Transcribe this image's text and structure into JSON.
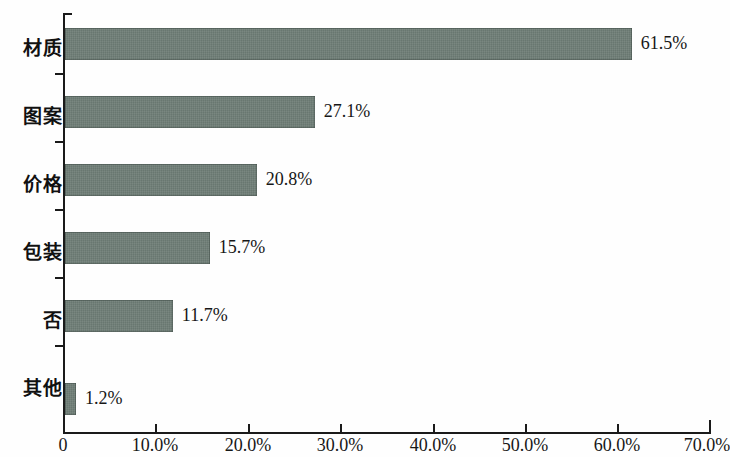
{
  "chart_data": {
    "type": "bar",
    "orientation": "horizontal",
    "title": "",
    "subtitle": "",
    "xlabel": "",
    "ylabel": "",
    "categories": [
      "材质",
      "图案",
      "价格",
      "包装",
      "否",
      "其他"
    ],
    "values": [
      61.5,
      27.1,
      20.8,
      15.7,
      11.7,
      1.2
    ],
    "value_labels": [
      "61.5%",
      "27.1%",
      "20.8%",
      "15.7%",
      "11.7%",
      "1.2%"
    ],
    "xlim": [
      0,
      70
    ],
    "xticks": [
      0,
      10,
      20,
      30,
      40,
      50,
      60,
      70
    ],
    "xtick_labels": [
      "0",
      "10.0%",
      "20.0%",
      "30.0%",
      "40.0%",
      "50.0%",
      "60.0%",
      "70.0%"
    ],
    "grid": false,
    "legend": null,
    "series": [
      {
        "name": "",
        "values": [
          61.5,
          27.1,
          20.8,
          15.7,
          11.7,
          1.2
        ]
      }
    ],
    "colors": {
      "bar": "#6d7c75",
      "axis": "#1a1a1a",
      "text": "#171717",
      "background": "#fefefe"
    }
  },
  "bars": [
    {
      "category": "材质",
      "value": 61.5,
      "label": "61.5%"
    },
    {
      "category": "图案",
      "value": 27.1,
      "label": "27.1%"
    },
    {
      "category": "价格",
      "value": 20.8,
      "label": "20.8%"
    },
    {
      "category": "包装",
      "value": 15.7,
      "label": "15.7%"
    },
    {
      "category": "否",
      "value": 11.7,
      "label": "11.7%"
    },
    {
      "category": "其他",
      "value": 1.2,
      "label": "1.2%"
    }
  ],
  "axis": {
    "x_tick_labels": [
      "0",
      "10.0%",
      "20.0%",
      "30.0%",
      "40.0%",
      "50.0%",
      "60.0%",
      "70.0%"
    ]
  }
}
